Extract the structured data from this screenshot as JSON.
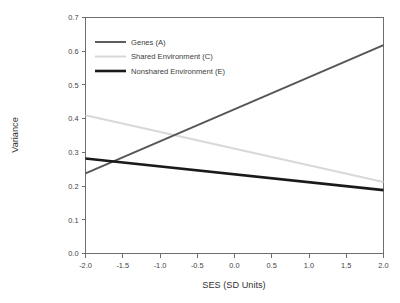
{
  "chart_data": {
    "type": "line",
    "title": "",
    "xlabel": "SES (SD Units)",
    "ylabel": "Variance",
    "xlim": [
      -2.0,
      2.0
    ],
    "ylim": [
      0.0,
      0.7
    ],
    "grid": false,
    "legend_position": "top-left inside",
    "x_ticks": [
      "-2.0",
      "-1.5",
      "-1.0",
      "-0.5",
      "0.0",
      "0.5",
      "1.0",
      "1.5",
      "2.0"
    ],
    "x_tick_values": [
      -2.0,
      -1.5,
      -1.0,
      -0.5,
      0.0,
      0.5,
      1.0,
      1.5,
      2.0
    ],
    "y_ticks": [
      "0.0",
      "0.1",
      "0.2",
      "0.3",
      "0.4",
      "0.5",
      "0.6",
      "0.7"
    ],
    "y_tick_values": [
      0.0,
      0.1,
      0.2,
      0.3,
      0.4,
      0.5,
      0.6,
      0.7
    ],
    "x": [
      -2.0,
      2.0
    ],
    "series": [
      {
        "name": "Genes (A)",
        "values": [
          0.238,
          0.618
        ],
        "color": "#555555",
        "width": 1.9
      },
      {
        "name": "Shared Environment (C)",
        "values": [
          0.41,
          0.212
        ],
        "color": "#d8d8d8",
        "width": 2.0
      },
      {
        "name": "Nonshared Environment (E)",
        "values": [
          0.282,
          0.188
        ],
        "color": "#1a1a1a",
        "width": 2.6
      }
    ],
    "annotations": [
      {
        "label": "A crosses E",
        "x": -1.55,
        "y": 0.27
      },
      {
        "label": "A crosses C",
        "x": -0.75,
        "y": 0.335
      }
    ]
  },
  "legend": {
    "items": [
      {
        "label": "Genes (A)"
      },
      {
        "label": "Shared Environment (C)"
      },
      {
        "label": "Nonshared Environment (E)"
      }
    ]
  },
  "axes": {
    "x_title": "SES (SD Units)",
    "y_title": "Variance"
  }
}
